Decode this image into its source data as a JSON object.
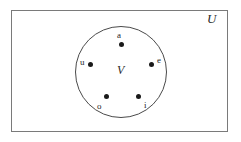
{
  "figure": {
    "type": "venn-diagram",
    "universe": {
      "label": "U",
      "shape": "rectangle"
    },
    "subset": {
      "label": "V",
      "shape": "circle"
    },
    "elements": [
      {
        "label": "a",
        "key": "a",
        "position": "top"
      },
      {
        "label": "u",
        "key": "u",
        "position": "left"
      },
      {
        "label": "e",
        "key": "e",
        "position": "right"
      },
      {
        "label": "o",
        "key": "o",
        "position": "bottom-left"
      },
      {
        "label": "i",
        "key": "i",
        "position": "bottom-right"
      }
    ],
    "colors": {
      "universe_border": "#7a7a7a",
      "subset_border": "#4a4a4a",
      "point_fill": "#1a1a1a",
      "text": "#1f1f1f",
      "background": "#ffffff"
    }
  }
}
